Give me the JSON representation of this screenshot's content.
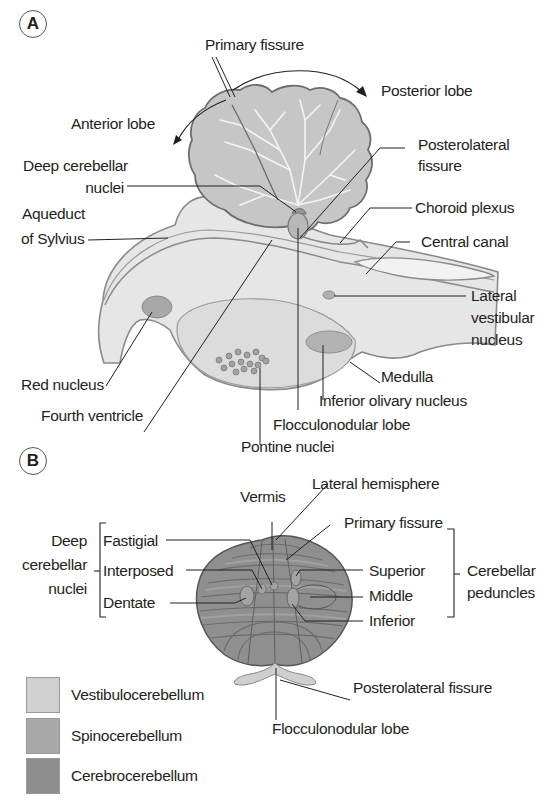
{
  "panels": {
    "A": {
      "badge": "A",
      "labels": {
        "primary_fissure": "Primary fissure",
        "posterior_lobe": "Posterior lobe",
        "anterior_lobe": "Anterior lobe",
        "posterolateral_fissure_1": "Posterolateral",
        "posterolateral_fissure_2": "fissure",
        "deep_nuclei_1": "Deep cerebellar",
        "deep_nuclei_2": "nuclei",
        "choroid_plexus": "Choroid plexus",
        "aqueduct_1": "Aqueduct",
        "aqueduct_2": "of Sylvius",
        "central_canal": "Central canal",
        "lateral_vestibular_1": "Lateral",
        "lateral_vestibular_2": "vestibular",
        "lateral_vestibular_3": "nucleus",
        "red_nucleus": "Red nucleus",
        "medulla": "Medulla",
        "fourth_ventricle": "Fourth ventricle",
        "inferior_olivary": "Inferior olivary nucleus",
        "flocculonodular": "Flocculonodular lobe",
        "pontine_nuclei": "Pontine nuclei"
      }
    },
    "B": {
      "badge": "B",
      "labels": {
        "vermis": "Vermis",
        "lateral_hemisphere": "Lateral hemisphere",
        "primary_fissure": "Primary fissure",
        "deep_1": "Deep",
        "deep_2": "cerebellar",
        "deep_3": "nuclei",
        "fastigial": "Fastigial",
        "interposed": "Interposed",
        "dentate": "Dentate",
        "superior": "Superior",
        "middle": "Middle",
        "inferior": "Inferior",
        "peduncles_1": "Cerebellar",
        "peduncles_2": "peduncles",
        "posterolateral_fissure": "Posterolateral fissure",
        "flocculonodular": "Flocculonodular lobe"
      }
    }
  },
  "legend": [
    {
      "label": "Vestibulocerebellum",
      "color": "#d0d0d0"
    },
    {
      "label": "Spinocerebellum",
      "color": "#a9a9a9"
    },
    {
      "label": "Cerebrocerebellum",
      "color": "#8e8e8e"
    }
  ],
  "colors": {
    "cerebellum_fill": "#c6c6c6",
    "cerebellum_stroke": "#6d6d6d",
    "brainstem_fill": "#e6e6e6",
    "brainstem_stroke": "#8a8a8a",
    "nucleus_fill": "#a8a8a8",
    "pons_fill": "#dcdcdc",
    "panelB_fill": "#8f8f8f",
    "panelB_line": "#5f5f5f",
    "leader_line": "#231f20"
  }
}
